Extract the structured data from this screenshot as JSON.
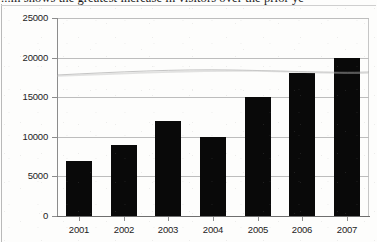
{
  "document": {
    "caption_clipped": "...m shows the greatest increase in visitors over the prior ye"
  },
  "chart_data": {
    "type": "bar",
    "title": "",
    "xlabel": "",
    "ylabel": "",
    "categories": [
      "2001",
      "2002",
      "2003",
      "2004",
      "2005",
      "2006",
      "2007"
    ],
    "values": [
      7000,
      9000,
      12000,
      10000,
      15000,
      18000,
      20000
    ],
    "ylim": [
      0,
      25000
    ],
    "yticks": [
      0,
      5000,
      10000,
      15000,
      20000,
      25000
    ],
    "ytick_labels": [
      "0",
      "5000",
      "10000",
      "15000",
      "20000",
      "25000"
    ],
    "grid": true,
    "legend": "none",
    "bar_color": "#090909",
    "gridline_color": "#bdbdbd",
    "axis_color": "#6e6e6e",
    "background_color": "#fdfdfc",
    "annotations": [
      {
        "name": "scan-crease-artifact",
        "description": "faint diagonal scanner crease line crossing the plot near 17500"
      }
    ]
  }
}
